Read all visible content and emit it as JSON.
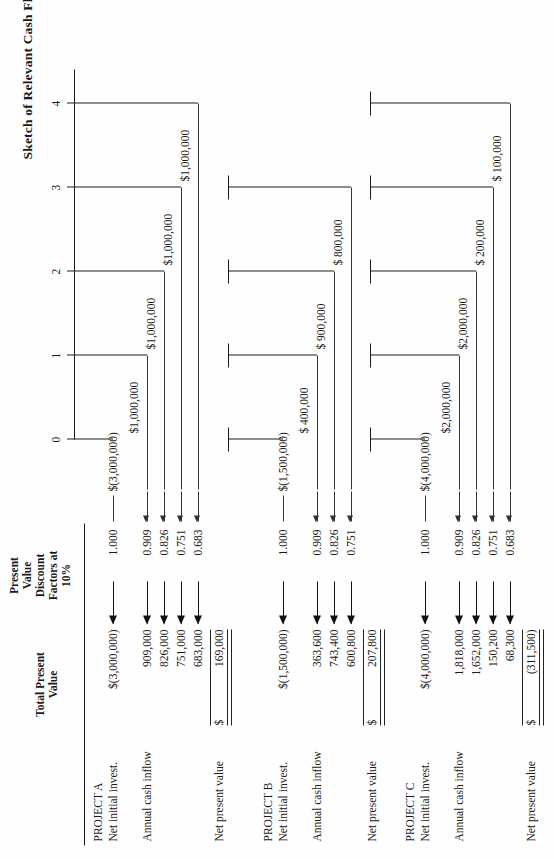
{
  "document": {
    "title": "Sketch of Relevant Cash Flows",
    "orientation": "landscape-rotated"
  },
  "columns": {
    "total_present_value": "Total Present\nValue",
    "total_present_value_line1": "Total Present",
    "total_present_value_line2": "Value",
    "discount_factor_line1": "Present",
    "discount_factor_line2": "Value",
    "discount_factor_line3": "Discount",
    "discount_factor_line4": "Factors at",
    "discount_factor_line5": "10%"
  },
  "timeline": {
    "ticks": [
      "0",
      "1",
      "2",
      "3",
      "4"
    ]
  },
  "row_labels": {
    "net_initial_invest": "Net initial invest.",
    "annual_cash_inflow": "Annual cash inflow",
    "net_present_value": "Net present value"
  },
  "projects": [
    {
      "name": "PROJECT A",
      "initial": {
        "total_present_value": "$(3,000,000)",
        "discount_factor": "1.000",
        "cash_flow": "$(3,000,000)",
        "period": 0
      },
      "inflows": [
        {
          "total_present_value": "909,000",
          "discount_factor": "0.909",
          "cash_flow": "$1,000,000",
          "period": 1
        },
        {
          "total_present_value": "826,000",
          "discount_factor": "0.826",
          "cash_flow": "$1,000,000",
          "period": 2
        },
        {
          "total_present_value": "751,000",
          "discount_factor": "0.751",
          "cash_flow": "$1,000,000",
          "period": 3
        },
        {
          "total_present_value": "683,000",
          "discount_factor": "0.683",
          "cash_flow": "$1,000,000",
          "period": 4
        }
      ],
      "npv_symbol": "$",
      "npv": "169,000"
    },
    {
      "name": "PROJECT B",
      "initial": {
        "total_present_value": "$(1,500,000)",
        "discount_factor": "1.000",
        "cash_flow": "$(1,500,000)",
        "period": 0
      },
      "inflows": [
        {
          "total_present_value": "363,600",
          "discount_factor": "0.909",
          "cash_flow": "$ 400,000",
          "period": 1
        },
        {
          "total_present_value": "743,400",
          "discount_factor": "0.826",
          "cash_flow": "$ 900,000",
          "period": 2
        },
        {
          "total_present_value": "600,800",
          "discount_factor": "0.751",
          "cash_flow": "$ 800,000",
          "period": 3
        }
      ],
      "npv_symbol": "$",
      "npv": "207,800"
    },
    {
      "name": "PROJECT C",
      "initial": {
        "total_present_value": "$(4,000,000)",
        "discount_factor": "1.000",
        "cash_flow": "$(4,000,000)",
        "period": 0
      },
      "inflows": [
        {
          "total_present_value": "1,818,000",
          "discount_factor": "0.909",
          "cash_flow": "$2,000,000",
          "period": 1
        },
        {
          "total_present_value": "1,652,000",
          "discount_factor": "0.826",
          "cash_flow": "$2,000,000",
          "period": 2
        },
        {
          "total_present_value": "150,200",
          "discount_factor": "0.751",
          "cash_flow": "$ 200,000",
          "period": 3
        },
        {
          "total_present_value": "68,300",
          "discount_factor": "0.683",
          "cash_flow": "$ 100,000",
          "period": 4
        }
      ],
      "npv_symbol": "$",
      "npv": "(311,500)"
    }
  ],
  "chart_data": {
    "type": "line",
    "title": "Sketch of Relevant Cash Flows",
    "xlabel": "",
    "ylabel": "",
    "x": [
      0,
      1,
      2,
      3,
      4
    ],
    "tick_labels": [
      "0",
      "1",
      "2",
      "3",
      "4"
    ],
    "grid": false,
    "legend": "none",
    "series": [
      {
        "name": "PROJECT A",
        "values": [
          -3000000,
          1000000,
          1000000,
          1000000,
          1000000
        ],
        "labels": [
          "$(3,000,000)",
          "$1,000,000",
          "$1,000,000",
          "$1,000,000",
          "$1,000,000"
        ]
      },
      {
        "name": "PROJECT B",
        "values": [
          -1500000,
          400000,
          900000,
          800000,
          null
        ],
        "labels": [
          "$(1,500,000)",
          "$ 400,000",
          "$ 900,000",
          "$ 800,000",
          ""
        ]
      },
      {
        "name": "PROJECT C",
        "values": [
          -4000000,
          2000000,
          2000000,
          200000,
          100000
        ],
        "labels": [
          "$(4,000,000)",
          "$2,000,000",
          "$2,000,000",
          "$ 200,000",
          "$ 100,000"
        ]
      }
    ],
    "discount_rate": "10%",
    "discount_factors": [
      1.0,
      0.909,
      0.826,
      0.751,
      0.683
    ],
    "net_present_values": {
      "PROJECT A": 169000,
      "PROJECT B": 207800,
      "PROJECT C": -311500
    }
  }
}
